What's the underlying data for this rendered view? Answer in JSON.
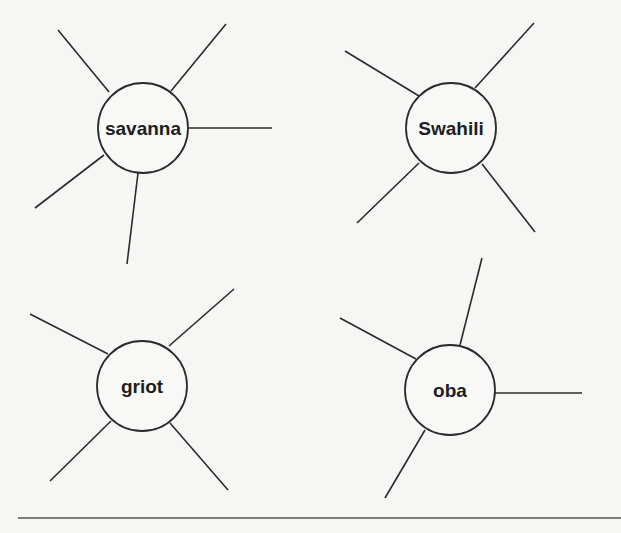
{
  "diagram": {
    "type": "word-web",
    "webs": [
      {
        "word": "savanna",
        "center": [
          143,
          128
        ],
        "radius": 45,
        "spokes": [
          [
            58,
            30,
            109,
            92
          ],
          [
            226,
            24,
            171,
            91
          ],
          [
            188,
            128,
            272,
            128
          ],
          [
            35,
            208,
            104,
            155
          ],
          [
            138,
            173,
            127,
            264
          ]
        ]
      },
      {
        "word": "Swahili",
        "center": [
          451,
          128
        ],
        "radius": 45,
        "spokes": [
          [
            345,
            51,
            419,
            96
          ],
          [
            534,
            23,
            475,
            88
          ],
          [
            357,
            223,
            419,
            163
          ],
          [
            535,
            232,
            482,
            164
          ]
        ]
      },
      {
        "word": "griot",
        "center": [
          142,
          386
        ],
        "radius": 45,
        "spokes": [
          [
            30,
            314,
            108,
            354
          ],
          [
            234,
            289,
            169,
            346
          ],
          [
            50,
            481,
            111,
            421
          ],
          [
            228,
            490,
            170,
            423
          ]
        ]
      },
      {
        "word": "oba",
        "center": [
          450,
          390
        ],
        "radius": 45,
        "spokes": [
          [
            482,
            258,
            460,
            345
          ],
          [
            340,
            318,
            416,
            359
          ],
          [
            495,
            393,
            582,
            393
          ],
          [
            385,
            498,
            425,
            430
          ]
        ]
      }
    ]
  },
  "footer": {
    "rule_y": 518
  }
}
